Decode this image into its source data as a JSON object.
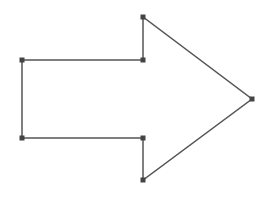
{
  "diagram": {
    "shape": "right-arrow",
    "stroke_color": "#555555",
    "handle_color": "#444444",
    "fill_color": "#ffffff",
    "stroke_width": 1.5,
    "handle_size": 5,
    "vertices": [
      {
        "name": "left-top",
        "x": 22,
        "y": 60
      },
      {
        "name": "shaft-top-right",
        "x": 143,
        "y": 60
      },
      {
        "name": "head-top",
        "x": 143,
        "y": 17
      },
      {
        "name": "tip",
        "x": 252,
        "y": 99
      },
      {
        "name": "head-bottom",
        "x": 143,
        "y": 180
      },
      {
        "name": "shaft-bottom-right",
        "x": 143,
        "y": 138
      },
      {
        "name": "left-bottom",
        "x": 22,
        "y": 138
      }
    ]
  }
}
